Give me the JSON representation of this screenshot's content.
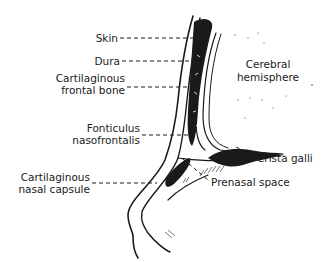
{
  "diagram": {
    "labels": {
      "skin": "Skin",
      "dura": "Dura",
      "frontal_bone_1": "Cartilaginous",
      "frontal_bone_2": "frontal bone",
      "fonticulus_1": "Fonticulus",
      "fonticulus_2": "nasofrontalis",
      "nasal_capsule_1": "Cartilaginous",
      "nasal_capsule_2": "nasal capsule",
      "cerebral_1": "Cerebral",
      "cerebral_2": "hemisphere",
      "crista_galli": "Crista galli",
      "prenasal_space": "Prenasal space"
    },
    "colors": {
      "ink": "#1a1a1a",
      "background": "#ffffff"
    }
  }
}
